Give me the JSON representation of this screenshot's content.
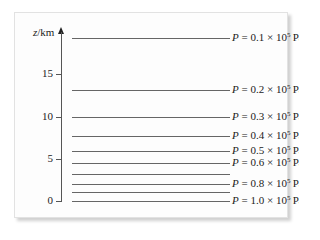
{
  "diagram": {
    "y_axis": {
      "label_var": "z",
      "label_unit": "/km",
      "ticks": [
        {
          "value": "15",
          "y": 74
        },
        {
          "value": "10",
          "y": 117
        },
        {
          "value": "5",
          "y": 159
        },
        {
          "value": "0",
          "y": 201
        }
      ]
    },
    "isobars": [
      {
        "y": 38,
        "label": {
          "var": "P",
          "coef": "0.1",
          "exp": "5",
          "unit": "Pa"
        }
      },
      {
        "y": 90,
        "label": {
          "var": "P",
          "coef": "0.2",
          "exp": "5",
          "unit": "Pa"
        }
      },
      {
        "y": 117,
        "label": {
          "var": "P",
          "coef": "0.3",
          "exp": "5",
          "unit": "Pa"
        }
      },
      {
        "y": 136,
        "label": {
          "var": "P",
          "coef": "0.4",
          "exp": "5",
          "unit": "Pa"
        }
      },
      {
        "y": 151,
        "label": {
          "var": "P",
          "coef": "0.5",
          "exp": "5",
          "unit": "Pa"
        }
      },
      {
        "y": 163,
        "label": {
          "var": "P",
          "coef": "0.6",
          "exp": "5",
          "unit": "Pa"
        }
      },
      {
        "y": 174,
        "label": null
      },
      {
        "y": 184,
        "label": {
          "var": "P",
          "coef": "0.8",
          "exp": "5",
          "unit": "Pa"
        }
      },
      {
        "y": 192,
        "label": null
      },
      {
        "y": 201,
        "label": {
          "var": "P",
          "coef": "1.0",
          "exp": "5",
          "unit": "Pa"
        }
      }
    ]
  },
  "chart_data": {
    "type": "line",
    "title": "",
    "ylabel": "z/km",
    "xlabel": "",
    "ylim": [
      0,
      19
    ],
    "y_ticks": [
      0,
      5,
      10,
      15
    ],
    "series": [
      {
        "name": "P = 0.1 × 10^5 Pa",
        "z_km": 19.5
      },
      {
        "name": "P = 0.2 × 10^5 Pa",
        "z_km": 13.1
      },
      {
        "name": "P = 0.3 × 10^5 Pa",
        "z_km": 10.0
      },
      {
        "name": "P = 0.4 × 10^5 Pa",
        "z_km": 7.7
      },
      {
        "name": "P = 0.5 × 10^5 Pa",
        "z_km": 6.0
      },
      {
        "name": "P = 0.6 × 10^5 Pa",
        "z_km": 4.5
      },
      {
        "name": "P = 0.7 × 10^5 Pa (unlabeled)",
        "z_km": 3.2
      },
      {
        "name": "P = 0.8 × 10^5 Pa",
        "z_km": 2.0
      },
      {
        "name": "P = 0.9 × 10^5 Pa (unlabeled)",
        "z_km": 1.0
      },
      {
        "name": "P = 1.0 × 10^5 Pa",
        "z_km": 0.0
      }
    ]
  }
}
